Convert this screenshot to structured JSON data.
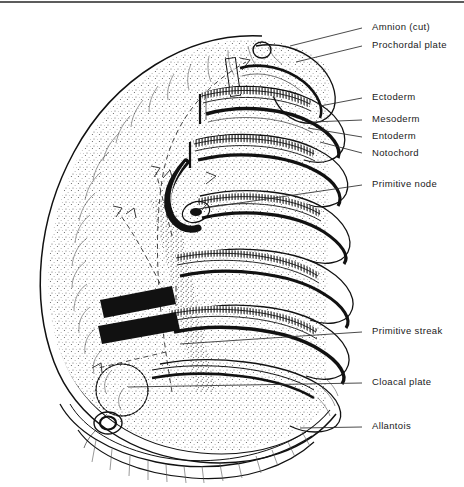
{
  "figure": {
    "background_color": "#ffffff",
    "ink_color": "#111111",
    "label_color": "#1a1a1a"
  },
  "labels": [
    {
      "id": "amnion",
      "text": "Amnion (cut)",
      "text_x": 372,
      "text_y": 27,
      "leader": "M 290,46 L 362,28"
    },
    {
      "id": "prochordal",
      "text": "Prochordal plate",
      "text_x": 372,
      "text_y": 45,
      "leader": "M 296,62 L 362,46"
    },
    {
      "id": "ectoderm",
      "text": "Ectoderm",
      "text_x": 372,
      "text_y": 97,
      "leader": "M 320,106 L 362,98"
    },
    {
      "id": "mesoderm",
      "text": "Mesoderm",
      "text_x": 372,
      "text_y": 119,
      "leader": "M 312,122 L 362,120"
    },
    {
      "id": "entoderm",
      "text": "Entoderm",
      "text_x": 372,
      "text_y": 136,
      "leader": "M 308,128 L 362,137"
    },
    {
      "id": "notochord",
      "text": "Notochord",
      "text_x": 372,
      "text_y": 153,
      "leader": "M 320,142 L 362,153"
    },
    {
      "id": "primitive-node",
      "text": "Primitive node",
      "text_x": 372,
      "text_y": 184,
      "leader": "M 205,208 L 362,185"
    },
    {
      "id": "primitive-streak",
      "text": "Primitive streak",
      "text_x": 372,
      "text_y": 331,
      "leader": "M 180,344 L 362,332"
    },
    {
      "id": "cloacal-plate",
      "text": "Cloacal plate",
      "text_x": 372,
      "text_y": 382,
      "leader": "M 128,387 L 362,383"
    },
    {
      "id": "allantois",
      "text": "Allantois",
      "text_x": 372,
      "text_y": 426,
      "leader": "M 300,428 L 362,427"
    }
  ],
  "anatomy": {
    "disc_outline_note": "Large stippled ovoid amnion-covered disc occupying left and centre",
    "sections_count": 7,
    "germ_layers": [
      "Ectoderm",
      "Mesoderm",
      "Entoderm"
    ],
    "structures": [
      "Amnion (cut)",
      "Prochordal plate",
      "Notochord",
      "Primitive node",
      "Primitive streak",
      "Cloacal plate",
      "Allantois"
    ],
    "migration_arrows": 4
  }
}
